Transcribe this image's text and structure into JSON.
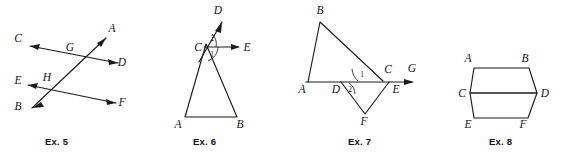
{
  "page": {
    "background_color": "#ffffff",
    "ink_color": "#1a1a1a",
    "width": 563,
    "height": 163
  },
  "figures": [
    {
      "id": "ex5",
      "caption": "Ex. 5",
      "caption_x": 45,
      "caption_y": 136,
      "description": "Two transversal lines crossed by a third line forming intersection points G and H",
      "points": [
        {
          "label": "C",
          "x": 18,
          "y": 42
        },
        {
          "label": "A",
          "x": 112,
          "y": 32
        },
        {
          "label": "G",
          "x": 70,
          "y": 51
        },
        {
          "label": "D",
          "x": 122,
          "y": 66
        },
        {
          "label": "E",
          "x": 18,
          "y": 84
        },
        {
          "label": "H",
          "x": 47,
          "y": 81
        },
        {
          "label": "B",
          "x": 18,
          "y": 110
        },
        {
          "label": "F",
          "x": 122,
          "y": 106
        }
      ]
    },
    {
      "id": "ex6",
      "caption": "Ex. 6",
      "caption_x": 193,
      "caption_y": 136,
      "description": "Triangle ABC with ray CD extended upward and ray CE horizontal, angles 1 and 2 at vertex C",
      "points": [
        {
          "label": "D",
          "x": 218,
          "y": 14
        },
        {
          "label": "C",
          "x": 198,
          "y": 47
        },
        {
          "label": "E",
          "x": 245,
          "y": 47
        },
        {
          "label": "A",
          "x": 178,
          "y": 122
        },
        {
          "label": "B",
          "x": 238,
          "y": 122
        }
      ],
      "angles": [
        {
          "label": "2",
          "x": 214,
          "y": 38
        },
        {
          "label": "1",
          "x": 215,
          "y": 54
        }
      ]
    },
    {
      "id": "ex7",
      "caption": "Ex. 7",
      "caption_x": 330,
      "caption_y": 136,
      "description": "Triangle ABC above ray AG and triangle DFE below it, angles 1 and 2 marked",
      "points": [
        {
          "label": "B",
          "x": 320,
          "y": 14
        },
        {
          "label": "A",
          "x": 302,
          "y": 93
        },
        {
          "label": "D",
          "x": 336,
          "y": 93
        },
        {
          "label": "C",
          "x": 388,
          "y": 73
        },
        {
          "label": "G",
          "x": 412,
          "y": 72
        },
        {
          "label": "E",
          "x": 396,
          "y": 93
        },
        {
          "label": "F",
          "x": 364,
          "y": 122
        }
      ],
      "angles": [
        {
          "label": "1",
          "x": 366,
          "y": 74
        },
        {
          "label": "2",
          "x": 352,
          "y": 88
        }
      ]
    },
    {
      "id": "ex8",
      "caption": "Ex. 8",
      "caption_x": 480,
      "caption_y": 136,
      "description": "Two stacked parallelograms ABDC and CDFE sharing side CD",
      "points": [
        {
          "label": "A",
          "x": 468,
          "y": 62
        },
        {
          "label": "B",
          "x": 525,
          "y": 62
        },
        {
          "label": "C",
          "x": 462,
          "y": 93
        },
        {
          "label": "D",
          "x": 543,
          "y": 93
        },
        {
          "label": "E",
          "x": 468,
          "y": 124
        },
        {
          "label": "F",
          "x": 523,
          "y": 124
        }
      ]
    }
  ]
}
